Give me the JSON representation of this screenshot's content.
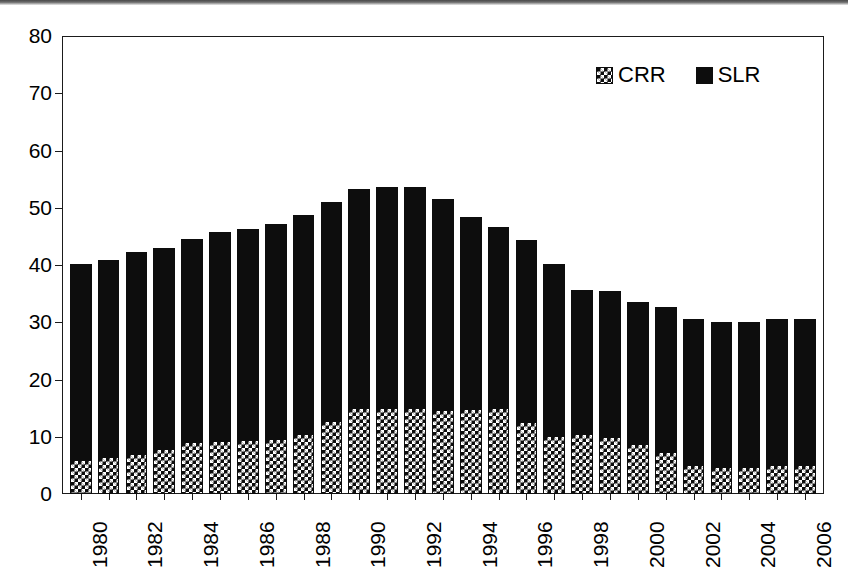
{
  "chart_data": {
    "type": "bar",
    "stacked": true,
    "title": "",
    "subtitle": "",
    "xlabel": "",
    "ylabel": "",
    "ylim": [
      0,
      80
    ],
    "yticks": [
      0,
      10,
      20,
      30,
      40,
      50,
      60,
      70,
      80
    ],
    "grid": false,
    "legend_position": "top-right",
    "categories": [
      "1980",
      "1981",
      "1982",
      "1983",
      "1984",
      "1985",
      "1986",
      "1987",
      "1988",
      "1989",
      "1990",
      "1991",
      "1992",
      "1993",
      "1994",
      "1995",
      "1996",
      "1997",
      "1998",
      "1999",
      "2000",
      "2001",
      "2002",
      "2003",
      "2004",
      "2005",
      "2006"
    ],
    "tick_labels": [
      "1980",
      "",
      "1982",
      "",
      "1984",
      "",
      "1986",
      "",
      "1988",
      "",
      "1990",
      "",
      "1992",
      "",
      "1994",
      "",
      "1996",
      "",
      "1998",
      "",
      "2000",
      "",
      "2002",
      "",
      "2004",
      "",
      "2006"
    ],
    "series": [
      {
        "name": "CRR",
        "pattern": "checkerboard",
        "color": "#0d0d0d",
        "values": [
          6.0,
          6.5,
          7.0,
          7.8,
          9.1,
          9.3,
          9.4,
          9.6,
          10.5,
          12.7,
          15.0,
          15.1,
          15.0,
          14.6,
          14.8,
          15.0,
          12.6,
          10.1,
          10.5,
          10.0,
          8.8,
          7.4,
          5.0,
          4.8,
          4.8,
          5.0,
          5.0
        ]
      },
      {
        "name": "SLR",
        "pattern": "solid",
        "color": "#0d0d0d",
        "values": [
          34.2,
          34.4,
          35.3,
          35.1,
          35.4,
          36.4,
          36.9,
          37.6,
          38.2,
          38.3,
          38.3,
          38.6,
          38.6,
          36.9,
          33.6,
          31.6,
          31.7,
          30.0,
          25.2,
          25.5,
          24.8,
          25.3,
          25.5,
          25.3,
          25.3,
          25.5,
          25.5
        ]
      }
    ],
    "totals": [
      40.2,
      40.9,
      42.3,
      42.9,
      44.5,
      45.7,
      46.3,
      47.2,
      48.7,
      51.0,
      53.3,
      53.7,
      53.6,
      51.5,
      48.4,
      46.6,
      44.3,
      40.1,
      35.7,
      35.5,
      33.6,
      32.7,
      30.5,
      30.1,
      30.1,
      30.5,
      30.5
    ]
  },
  "legend": {
    "items": [
      {
        "label": "CRR",
        "swatch": "checkerboard"
      },
      {
        "label": "SLR",
        "swatch": "solid"
      }
    ]
  }
}
